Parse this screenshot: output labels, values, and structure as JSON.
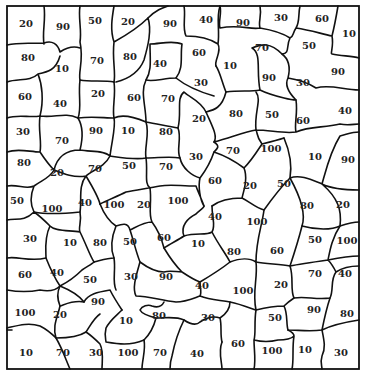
{
  "map": {
    "type": "numbered-region-map",
    "frame": {
      "x": 7,
      "y": 6,
      "width": 352,
      "height": 363
    },
    "colors": {
      "background": "#ffffff",
      "border": "#111111",
      "text": "#222222"
    },
    "regions": [
      {
        "value": "20",
        "x": 26,
        "y": 24
      },
      {
        "value": "90",
        "x": 63,
        "y": 27
      },
      {
        "value": "50",
        "x": 95,
        "y": 21
      },
      {
        "value": "20",
        "x": 128,
        "y": 22
      },
      {
        "value": "90",
        "x": 170,
        "y": 24
      },
      {
        "value": "40",
        "x": 206,
        "y": 20
      },
      {
        "value": "90",
        "x": 243,
        "y": 23
      },
      {
        "value": "30",
        "x": 281,
        "y": 18
      },
      {
        "value": "60",
        "x": 322,
        "y": 19
      },
      {
        "value": "10",
        "x": 349,
        "y": 34
      },
      {
        "value": "80",
        "x": 28,
        "y": 58
      },
      {
        "value": "10",
        "x": 62,
        "y": 69
      },
      {
        "value": "70",
        "x": 97,
        "y": 61
      },
      {
        "value": "80",
        "x": 130,
        "y": 57
      },
      {
        "value": "40",
        "x": 160,
        "y": 64
      },
      {
        "value": "60",
        "x": 199,
        "y": 53
      },
      {
        "value": "10",
        "x": 230,
        "y": 66
      },
      {
        "value": "70",
        "x": 262,
        "y": 48
      },
      {
        "value": "50",
        "x": 309,
        "y": 46
      },
      {
        "value": "90",
        "x": 338,
        "y": 72
      },
      {
        "value": "60",
        "x": 25,
        "y": 97
      },
      {
        "value": "40",
        "x": 60,
        "y": 104
      },
      {
        "value": "20",
        "x": 98,
        "y": 94
      },
      {
        "value": "60",
        "x": 134,
        "y": 98
      },
      {
        "value": "70",
        "x": 168,
        "y": 99
      },
      {
        "value": "30",
        "x": 201,
        "y": 83
      },
      {
        "value": "90",
        "x": 269,
        "y": 78
      },
      {
        "value": "30",
        "x": 303,
        "y": 83
      },
      {
        "value": "30",
        "x": 23,
        "y": 132
      },
      {
        "value": "70",
        "x": 62,
        "y": 141
      },
      {
        "value": "90",
        "x": 96,
        "y": 131
      },
      {
        "value": "10",
        "x": 128,
        "y": 131
      },
      {
        "value": "80",
        "x": 166,
        "y": 132
      },
      {
        "value": "20",
        "x": 199,
        "y": 119
      },
      {
        "value": "80",
        "x": 236,
        "y": 114
      },
      {
        "value": "50",
        "x": 272,
        "y": 115
      },
      {
        "value": "60",
        "x": 303,
        "y": 121
      },
      {
        "value": "40",
        "x": 345,
        "y": 111
      },
      {
        "value": "80",
        "x": 24,
        "y": 163
      },
      {
        "value": "20",
        "x": 57,
        "y": 173
      },
      {
        "value": "70",
        "x": 95,
        "y": 169
      },
      {
        "value": "50",
        "x": 129,
        "y": 166
      },
      {
        "value": "70",
        "x": 166,
        "y": 167
      },
      {
        "value": "30",
        "x": 196,
        "y": 157
      },
      {
        "value": "70",
        "x": 233,
        "y": 151
      },
      {
        "value": "100",
        "x": 271,
        "y": 149
      },
      {
        "value": "10",
        "x": 315,
        "y": 157
      },
      {
        "value": "90",
        "x": 348,
        "y": 160
      },
      {
        "value": "50",
        "x": 17,
        "y": 201
      },
      {
        "value": "100",
        "x": 52,
        "y": 209
      },
      {
        "value": "40",
        "x": 85,
        "y": 203
      },
      {
        "value": "100",
        "x": 114,
        "y": 205
      },
      {
        "value": "20",
        "x": 144,
        "y": 205
      },
      {
        "value": "100",
        "x": 178,
        "y": 201
      },
      {
        "value": "60",
        "x": 215,
        "y": 181
      },
      {
        "value": "20",
        "x": 250,
        "y": 186
      },
      {
        "value": "50",
        "x": 284,
        "y": 184
      },
      {
        "value": "80",
        "x": 307,
        "y": 206
      },
      {
        "value": "20",
        "x": 343,
        "y": 205
      },
      {
        "value": "40",
        "x": 215,
        "y": 217
      },
      {
        "value": "100",
        "x": 257,
        "y": 222
      },
      {
        "value": "30",
        "x": 30,
        "y": 239
      },
      {
        "value": "10",
        "x": 70,
        "y": 243
      },
      {
        "value": "80",
        "x": 100,
        "y": 243
      },
      {
        "value": "50",
        "x": 130,
        "y": 242
      },
      {
        "value": "60",
        "x": 164,
        "y": 238
      },
      {
        "value": "10",
        "x": 198,
        "y": 244
      },
      {
        "value": "80",
        "x": 234,
        "y": 252
      },
      {
        "value": "60",
        "x": 277,
        "y": 251
      },
      {
        "value": "50",
        "x": 315,
        "y": 240
      },
      {
        "value": "100",
        "x": 347,
        "y": 241
      },
      {
        "value": "60",
        "x": 25,
        "y": 275
      },
      {
        "value": "40",
        "x": 57,
        "y": 273
      },
      {
        "value": "50",
        "x": 90,
        "y": 280
      },
      {
        "value": "30",
        "x": 131,
        "y": 277
      },
      {
        "value": "90",
        "x": 166,
        "y": 277
      },
      {
        "value": "40",
        "x": 202,
        "y": 286
      },
      {
        "value": "100",
        "x": 243,
        "y": 291
      },
      {
        "value": "20",
        "x": 281,
        "y": 285
      },
      {
        "value": "70",
        "x": 315,
        "y": 274
      },
      {
        "value": "40",
        "x": 345,
        "y": 274
      },
      {
        "value": "100",
        "x": 25,
        "y": 313
      },
      {
        "value": "20",
        "x": 60,
        "y": 315
      },
      {
        "value": "90",
        "x": 98,
        "y": 302
      },
      {
        "value": "10",
        "x": 126,
        "y": 321
      },
      {
        "value": "80",
        "x": 159,
        "y": 316
      },
      {
        "value": "30",
        "x": 208,
        "y": 318
      },
      {
        "value": "50",
        "x": 275,
        "y": 318
      },
      {
        "value": "90",
        "x": 314,
        "y": 310
      },
      {
        "value": "80",
        "x": 347,
        "y": 314
      },
      {
        "value": "10",
        "x": 26,
        "y": 353
      },
      {
        "value": "70",
        "x": 63,
        "y": 353
      },
      {
        "value": "30",
        "x": 96,
        "y": 353
      },
      {
        "value": "100",
        "x": 128,
        "y": 353
      },
      {
        "value": "70",
        "x": 160,
        "y": 353
      },
      {
        "value": "40",
        "x": 197,
        "y": 354
      },
      {
        "value": "60",
        "x": 238,
        "y": 344
      },
      {
        "value": "100",
        "x": 272,
        "y": 351
      },
      {
        "value": "10",
        "x": 305,
        "y": 350
      },
      {
        "value": "30",
        "x": 341,
        "y": 353
      }
    ]
  }
}
